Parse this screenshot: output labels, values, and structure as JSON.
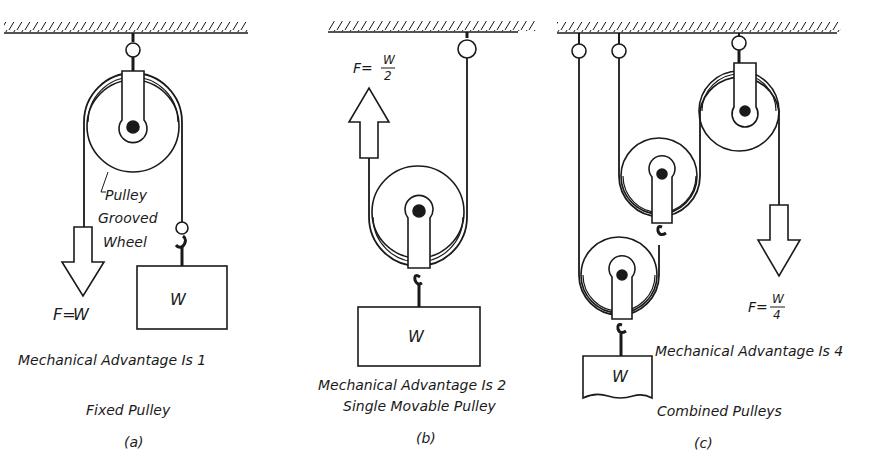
{
  "figure": {
    "panels": [
      {
        "id": "a",
        "title": "Fixed Pulley",
        "tag": "(a)",
        "mechanical_advantage": "Mechanical Advantage Is 1",
        "force": {
          "lhs": "F=",
          "value": "W"
        },
        "weight_label": "W",
        "callout": [
          "Pulley",
          "Grooved",
          "Wheel"
        ]
      },
      {
        "id": "b",
        "title": "Single Movable Pulley",
        "tag": "(b)",
        "mechanical_advantage": "Mechanical Advantage Is 2",
        "force": {
          "lhs": "F=",
          "num": "W",
          "den": "2"
        },
        "weight_label": "W"
      },
      {
        "id": "c",
        "title": "Combined Pulleys",
        "tag": "(c)",
        "mechanical_advantage": "Mechanical Advantage Is 4",
        "force": {
          "lhs": "F=",
          "num": "W",
          "den": "4"
        },
        "weight_label": "W"
      }
    ],
    "colors": {
      "ink": "#1a1a1a",
      "paper": "#ffffff"
    }
  }
}
